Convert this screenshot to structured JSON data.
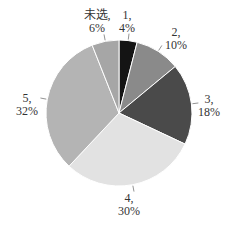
{
  "chart_data": {
    "type": "pie",
    "title": "",
    "categories": [
      "1",
      "2",
      "3",
      "4",
      "5",
      "未选"
    ],
    "values": [
      4,
      10,
      18,
      30,
      32,
      6
    ],
    "unit": "%",
    "start_angle": "12 o'clock",
    "direction": "clockwise",
    "colors": [
      "#141414",
      "#8a8a8a",
      "#4a4a4a",
      "#e2e2e2",
      "#b4b4b4",
      "#a6a6a6"
    ],
    "labels": [
      {
        "name": "1,",
        "pct": "4%"
      },
      {
        "name": "2,",
        "pct": "10%"
      },
      {
        "name": "3,",
        "pct": "18%"
      },
      {
        "name": "4,",
        "pct": "30%"
      },
      {
        "name": "5,",
        "pct": "32%"
      },
      {
        "name": "未选,",
        "pct": "6%"
      }
    ],
    "legend": "none",
    "data_labels": "category, percentage"
  }
}
